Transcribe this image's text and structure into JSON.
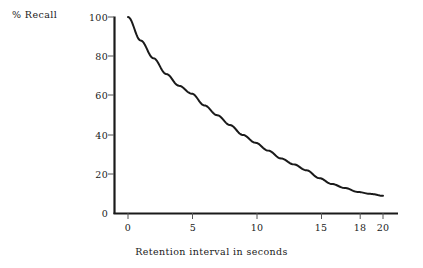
{
  "chart_data": {
    "type": "line",
    "title": "",
    "subtitle": "",
    "xlabel": "Retention interval in seconds",
    "ylabel": "% Recall",
    "xlim": [
      0,
      20
    ],
    "ylim": [
      0,
      100
    ],
    "grid": false,
    "legend": "none",
    "xticks": [
      {
        "value": 0,
        "label": "0"
      },
      {
        "value": 5,
        "label": "5"
      },
      {
        "value": 10,
        "label": "10"
      },
      {
        "value": 15,
        "label": "15"
      },
      {
        "value": 18,
        "label": "18"
      },
      {
        "value": 20,
        "label": "20"
      }
    ],
    "yticks": [
      {
        "value": 0,
        "label": "0"
      },
      {
        "value": 20,
        "label": "20"
      },
      {
        "value": 40,
        "label": "40"
      },
      {
        "value": 60,
        "label": "60"
      },
      {
        "value": 80,
        "label": "80"
      },
      {
        "value": 100,
        "label": "100"
      }
    ],
    "series": [
      {
        "name": "Recall",
        "color": "#1a1a1a",
        "x": [
          0,
          1,
          2,
          3,
          4,
          5,
          6,
          7,
          8,
          9,
          10,
          11,
          12,
          13,
          14,
          15,
          16,
          17,
          18,
          19,
          20
        ],
        "values": [
          100,
          88,
          79,
          71,
          65,
          61,
          55,
          50,
          45,
          40,
          36,
          32,
          28,
          25,
          22,
          18,
          15,
          13,
          11,
          10,
          9
        ]
      }
    ]
  },
  "colors": {
    "background": "#ffffff",
    "axis": "#1a1a1a",
    "curve": "#1a1a1a",
    "text": "#1a1a1a"
  }
}
